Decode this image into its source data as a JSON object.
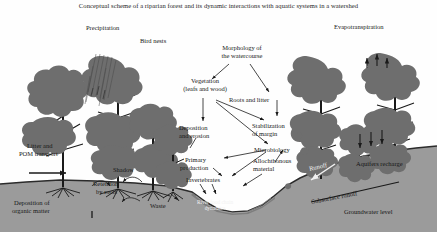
{
  "title": "Conceptual scheme of a riparian forest and its dynamic interactions with aquatic systems in a watershed",
  "labels": {
    "precipitation": "Precipitation",
    "bird_nests": "Bird nests",
    "morphology_l1": "Morphology of",
    "morphology_l2": "the watercourse",
    "evapotranspiration": "Evapotranspiration",
    "vegetation_l1": "Vegetation",
    "vegetation_l2": "(leafs and wood)",
    "roots_and_litter": "Roots and litter",
    "stabilization_l1": "Stabilization",
    "stabilization_l2": "of margin",
    "deposition_erosion_l1": "Deposition",
    "deposition_erosion_l2": "and erosion",
    "microbiology": "Microbiology",
    "allochthonous_l1": "Allochthonous",
    "allochthonous_l2": "material",
    "primary_production_l1": "Primary",
    "primary_production_l2": "production",
    "invertebrates": "Invertebrates",
    "litter_pom_l1": "Litter and",
    "litter_pom_l2": "POM transport",
    "shadow": "Shadow",
    "retention_l1": "Retention",
    "retention_l2": "by roots",
    "deposition_organic_l1": "Deposition of",
    "deposition_organic_l2": "organic matter",
    "waste": "Waste",
    "river_food_chain_l1": "River food chain",
    "river_food_chain_l2": "dynamics",
    "runoff": "Runoff",
    "aquifers_recharge": "Aquifers recharge",
    "subsurface_runoff": "Subsurface runoff",
    "groundwater_level": "Groundwater level"
  },
  "colors": {
    "canopy": "#6e6e6e",
    "trunk": "#1a1a1a",
    "ground": "#9b9b9b",
    "ground_edge": "#2b2b2b",
    "water": "#8f8f8f",
    "sky": "#fefefe",
    "text": "#161616",
    "text_on_water": "#f2f2f2"
  },
  "diagram": {
    "type": "conceptual-schematic",
    "trees_left_group": 4,
    "trees_right_group": 3,
    "arrows": [
      {
        "from": "morphology",
        "to": "vegetation"
      },
      {
        "from": "morphology",
        "to": "roots_and_litter"
      },
      {
        "from": "vegetation",
        "to": "deposition_erosion"
      },
      {
        "from": "vegetation",
        "to": "stabilization_of_margin"
      },
      {
        "from": "vegetation",
        "to": "microbiology"
      },
      {
        "from": "roots_and_litter",
        "to": "stabilization_of_margin"
      },
      {
        "from": "microbiology",
        "to": "primary_production"
      },
      {
        "from": "microbiology",
        "to": "invertebrates"
      },
      {
        "from": "allochthonous_material",
        "to": "microbiology"
      },
      {
        "from": "primary_production",
        "to": "invertebrates"
      },
      {
        "from": "invertebrates",
        "to": "river_food_chain_dynamics"
      },
      {
        "from": "litter_and_pom_transport",
        "to": "floodplain"
      },
      {
        "from": "runoff",
        "to": "river"
      },
      {
        "from": "precipitation",
        "to": "canopy"
      },
      {
        "from": "evapotranspiration",
        "to": "atmosphere"
      },
      {
        "from": "aquifers_recharge",
        "to": "groundwater"
      }
    ]
  }
}
